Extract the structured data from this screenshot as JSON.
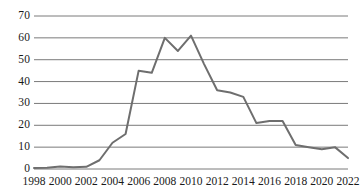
{
  "chart_data": {
    "type": "line",
    "title": "",
    "subtitle": "",
    "xlabel": "",
    "ylabel": "",
    "x": [
      1998,
      1999,
      2000,
      2001,
      2002,
      2003,
      2004,
      2005,
      2006,
      2007,
      2008,
      2009,
      2010,
      2011,
      2012,
      2013,
      2014,
      2015,
      2016,
      2017,
      2018,
      2019,
      2020,
      2021,
      2022
    ],
    "series": [
      {
        "name": "",
        "values": [
          0.5,
          0.6,
          1.2,
          0.8,
          1.0,
          4,
          12,
          16,
          45,
          44,
          60,
          54,
          61,
          48,
          36,
          35,
          33,
          21,
          22,
          22,
          11,
          10,
          9,
          10,
          5
        ]
      }
    ],
    "xlim": [
      1998,
      2022
    ],
    "ylim": [
      0,
      72
    ],
    "y_ticks": [
      0,
      10,
      20,
      30,
      40,
      50,
      60,
      70
    ],
    "y_tick_labels": [
      "0",
      "10",
      "20",
      "30",
      "40",
      "50",
      "60",
      "70"
    ],
    "x_ticks": [
      1998,
      2000,
      2002,
      2004,
      2006,
      2008,
      2010,
      2012,
      2014,
      2016,
      2018,
      2020,
      2022
    ],
    "x_tick_labels": [
      "1998",
      "2000",
      "2002",
      "2004",
      "2006",
      "2008",
      "2010",
      "2012",
      "2014",
      "2016",
      "2018",
      "2020",
      "2022"
    ],
    "grid": {
      "horizontal": true,
      "vertical": false,
      "color": "#7a7a7a"
    },
    "legend": {
      "visible": false,
      "position": "none",
      "entries": []
    },
    "line_color": "#6e6e6e",
    "line_width": 2.0,
    "markers": false,
    "background_color": "#ffffff",
    "axis_label_color": "#1a1a1a"
  }
}
